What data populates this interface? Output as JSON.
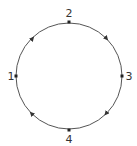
{
  "diagram": {
    "type": "cycle",
    "direction": "clockwise",
    "circle": {
      "cx": 69,
      "cy": 76,
      "r": 53,
      "stroke": "#555555"
    },
    "nodes": [
      {
        "id": "1",
        "label": "1",
        "x": 16,
        "y": 76,
        "label_x": 11,
        "label_y": 80
      },
      {
        "id": "2",
        "label": "2",
        "x": 69,
        "y": 22,
        "label_x": 69,
        "label_y": 17
      },
      {
        "id": "3",
        "label": "3",
        "x": 122,
        "y": 76,
        "label_x": 128,
        "label_y": 80
      },
      {
        "id": "4",
        "label": "4",
        "x": 69,
        "y": 130,
        "label_x": 69,
        "label_y": 142
      }
    ],
    "edges": [
      {
        "from": "1",
        "to": "2"
      },
      {
        "from": "2",
        "to": "3"
      },
      {
        "from": "3",
        "to": "4"
      },
      {
        "from": "4",
        "to": "1"
      }
    ],
    "colors": {
      "line": "#555555",
      "node": "#222222",
      "text": "#333333"
    }
  }
}
